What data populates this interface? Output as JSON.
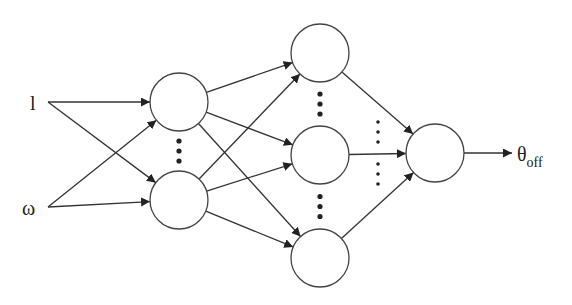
{
  "diagram": {
    "title": "",
    "type": "feedforward neural network",
    "inputs": [
      {
        "id": "in_l",
        "label": "l"
      },
      {
        "id": "in_w",
        "label": "ω"
      }
    ],
    "layers": [
      {
        "name": "hidden-layer-1",
        "nodes": [
          "h1a",
          "h1b"
        ],
        "ellipsis_between": [
          [
            0,
            1
          ]
        ]
      },
      {
        "name": "hidden-layer-2",
        "nodes": [
          "h2a",
          "h2b",
          "h2c"
        ],
        "ellipsis_between": [
          [
            0,
            1
          ],
          [
            1,
            2
          ]
        ]
      },
      {
        "name": "output-layer",
        "nodes": [
          "out"
        ]
      }
    ],
    "edges": [
      [
        "in_l",
        "h1a"
      ],
      [
        "in_l",
        "h1b"
      ],
      [
        "in_w",
        "h1a"
      ],
      [
        "in_w",
        "h1b"
      ],
      [
        "h1a",
        "h2a"
      ],
      [
        "h1a",
        "h2b"
      ],
      [
        "h1a",
        "h2c"
      ],
      [
        "h1b",
        "h2a"
      ],
      [
        "h1b",
        "h2b"
      ],
      [
        "h1b",
        "h2c"
      ],
      [
        "h2a",
        "out"
      ],
      [
        "h2b",
        "out"
      ],
      [
        "h2c",
        "out"
      ]
    ],
    "output": {
      "label_main": "θ",
      "label_sub": "off"
    }
  }
}
